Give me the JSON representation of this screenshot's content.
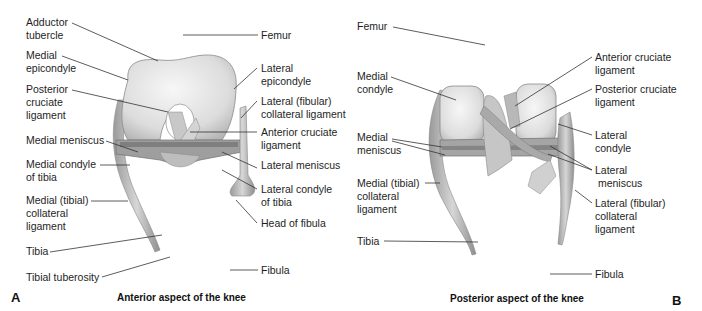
{
  "figure": {
    "panel_a": {
      "letter": "A",
      "caption": "Anterior aspect of the knee",
      "labels": {
        "adductor_tubercle": "Adductor\ntubercle",
        "medial_epicondyle": "Medial\nepicondyle",
        "posterior_cruciate": "Posterior\ncruciate\nligament",
        "medial_meniscus": "Medial meniscus",
        "medial_condyle_tibia": "Medial condyle\nof tibia",
        "medial_collateral": "Medial (tibial)\ncollateral\nligament",
        "tibia": "Tibia",
        "tibial_tuberosity": "Tibial tuberosity",
        "femur": "Femur",
        "lateral_epicondyle": "Lateral\nepicondyle",
        "lateral_collateral": "Lateral (fibular)\ncollateral ligament",
        "anterior_cruciate": "Anterior cruciate\nligament",
        "lateral_meniscus": "Lateral meniscus",
        "lateral_condyle_tibia": "Lateral condyle\nof tibia",
        "head_of_fibula": "Head of fibula",
        "fibula": "Fibula"
      }
    },
    "panel_b": {
      "letter": "B",
      "caption": "Posterior aspect of the knee",
      "labels": {
        "femur": "Femur",
        "medial_condyle": "Medial\ncondyle",
        "medial_meniscus": "Medial\nmeniscus",
        "medial_collateral": "Medial (tibial)\ncollateral\nligament",
        "tibia": "Tibia",
        "anterior_cruciate": "Anterior cruciate\nligament",
        "posterior_cruciate": "Posterior cruciate\nligament",
        "lateral_condyle": "Lateral\ncondyle",
        "lateral_meniscus": "Lateral\n meniscus",
        "lateral_collateral": "Lateral (fibular)\ncollateral\nligament",
        "fibula": "Fibula"
      }
    }
  }
}
